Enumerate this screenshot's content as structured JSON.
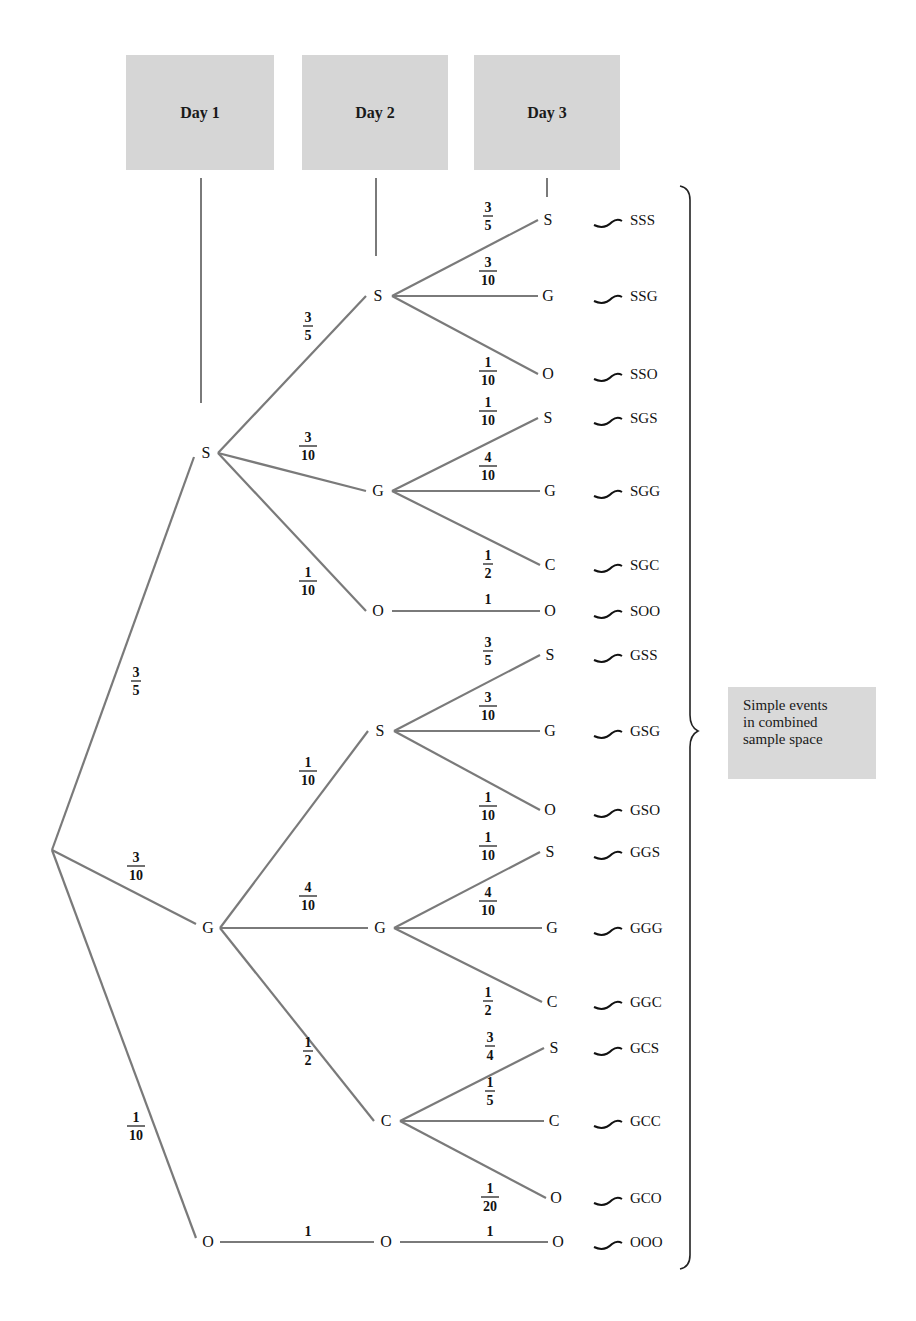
{
  "headers": [
    {
      "label": "Day 1",
      "x": 126,
      "y": 55,
      "w": 148,
      "h": 115
    },
    {
      "label": "Day 2",
      "x": 302,
      "y": 55,
      "w": 146,
      "h": 115
    },
    {
      "label": "Day 3",
      "x": 474,
      "y": 55,
      "w": 146,
      "h": 115
    }
  ],
  "note": {
    "lines": [
      "Simple events",
      "in combined",
      "sample space"
    ],
    "x": 728,
    "y": 687,
    "w": 148,
    "h": 92
  },
  "tree": {
    "root": {
      "x": 52,
      "y": 850
    },
    "day1": [
      {
        "id": "S",
        "label": "S",
        "x": 206,
        "y": 453,
        "prob_num": "3",
        "prob_den": "5",
        "px": 136,
        "py": 680
      },
      {
        "id": "G",
        "label": "G",
        "x": 208,
        "y": 928,
        "prob_num": "3",
        "prob_den": "10",
        "px": 136,
        "py": 865
      },
      {
        "id": "O",
        "label": "O",
        "x": 208,
        "y": 1242,
        "prob_num": "1",
        "prob_den": "10",
        "px": 136,
        "py": 1125
      }
    ],
    "day2": [
      {
        "id": "SS",
        "parent": "S",
        "label": "S",
        "x": 378,
        "y": 296,
        "prob_num": "3",
        "prob_den": "5",
        "px": 308,
        "py": 325
      },
      {
        "id": "SG",
        "parent": "S",
        "label": "G",
        "x": 378,
        "y": 491,
        "prob_num": "3",
        "prob_den": "10",
        "px": 308,
        "py": 445
      },
      {
        "id": "SO",
        "parent": "S",
        "label": "O",
        "x": 378,
        "y": 611,
        "prob_num": "1",
        "prob_den": "10",
        "px": 308,
        "py": 580
      },
      {
        "id": "GS",
        "parent": "G",
        "label": "S",
        "x": 380,
        "y": 731,
        "prob_num": "1",
        "prob_den": "10",
        "px": 308,
        "py": 770
      },
      {
        "id": "GG",
        "parent": "G",
        "label": "G",
        "x": 380,
        "y": 928,
        "prob_num": "4",
        "prob_den": "10",
        "px": 308,
        "py": 895
      },
      {
        "id": "GC",
        "parent": "G",
        "label": "C",
        "x": 386,
        "y": 1121,
        "prob_num": "1",
        "prob_den": "2",
        "px": 308,
        "py": 1050
      },
      {
        "id": "OO",
        "parent": "O",
        "label": "O",
        "x": 386,
        "y": 1242,
        "prob_num": "",
        "prob_den": "",
        "prob_single": "1",
        "px": 308,
        "py": 1236
      }
    ],
    "day3": [
      {
        "parent": "SS",
        "label": "S",
        "x": 548,
        "y": 220,
        "prob_num": "3",
        "prob_den": "5",
        "px": 488,
        "py": 215,
        "outcome": "SSS"
      },
      {
        "parent": "SS",
        "label": "G",
        "x": 548,
        "y": 296,
        "prob_num": "3",
        "prob_den": "10",
        "px": 488,
        "py": 270,
        "outcome": "SSG"
      },
      {
        "parent": "SS",
        "label": "O",
        "x": 548,
        "y": 374,
        "prob_num": "1",
        "prob_den": "10",
        "px": 488,
        "py": 370,
        "outcome": "SSO"
      },
      {
        "parent": "SG",
        "label": "S",
        "x": 548,
        "y": 418,
        "prob_num": "1",
        "prob_den": "10",
        "px": 488,
        "py": 410,
        "outcome": "SGS"
      },
      {
        "parent": "SG",
        "label": "G",
        "x": 550,
        "y": 491,
        "prob_num": "4",
        "prob_den": "10",
        "px": 488,
        "py": 465,
        "outcome": "SGG"
      },
      {
        "parent": "SG",
        "label": "C",
        "x": 550,
        "y": 565,
        "prob_num": "1",
        "prob_den": "2",
        "px": 488,
        "py": 563,
        "outcome": "SGC"
      },
      {
        "parent": "SO",
        "label": "O",
        "x": 550,
        "y": 611,
        "prob_num": "",
        "prob_den": "",
        "prob_single": "1",
        "px": 488,
        "py": 604,
        "outcome": "SOO"
      },
      {
        "parent": "GS",
        "label": "S",
        "x": 550,
        "y": 655,
        "prob_num": "3",
        "prob_den": "5",
        "px": 488,
        "py": 650,
        "outcome": "GSS"
      },
      {
        "parent": "GS",
        "label": "G",
        "x": 550,
        "y": 731,
        "prob_num": "3",
        "prob_den": "10",
        "px": 488,
        "py": 705,
        "outcome": "GSG"
      },
      {
        "parent": "GS",
        "label": "O",
        "x": 550,
        "y": 810,
        "prob_num": "1",
        "prob_den": "10",
        "px": 488,
        "py": 805,
        "outcome": "GSO"
      },
      {
        "parent": "GG",
        "label": "S",
        "x": 550,
        "y": 852,
        "prob_num": "1",
        "prob_den": "10",
        "px": 488,
        "py": 845,
        "outcome": "GGS"
      },
      {
        "parent": "GG",
        "label": "G",
        "x": 552,
        "y": 928,
        "prob_num": "4",
        "prob_den": "10",
        "px": 488,
        "py": 900,
        "outcome": "GGG"
      },
      {
        "parent": "GG",
        "label": "C",
        "x": 552,
        "y": 1002,
        "prob_num": "1",
        "prob_den": "2",
        "px": 488,
        "py": 1000,
        "outcome": "GGC"
      },
      {
        "parent": "GC",
        "label": "S",
        "x": 554,
        "y": 1048,
        "prob_num": "3",
        "prob_den": "4",
        "px": 490,
        "py": 1045,
        "outcome": "GCS"
      },
      {
        "parent": "GC",
        "label": "C",
        "x": 554,
        "y": 1121,
        "prob_num": "1",
        "prob_den": "5",
        "px": 490,
        "py": 1090,
        "outcome": "GCC"
      },
      {
        "parent": "GC",
        "label": "O",
        "x": 556,
        "y": 1198,
        "prob_num": "1",
        "prob_den": "20",
        "px": 490,
        "py": 1196,
        "outcome": "GCO"
      },
      {
        "parent": "OO",
        "label": "O",
        "x": 558,
        "y": 1242,
        "prob_num": "",
        "prob_den": "",
        "prob_single": "1",
        "px": 490,
        "py": 1236,
        "outcome": "OOO"
      }
    ]
  },
  "colors": {
    "line": "#7a7a7a",
    "text": "#111111",
    "box_fill": "#d6d6d6",
    "brace": "#222222"
  }
}
